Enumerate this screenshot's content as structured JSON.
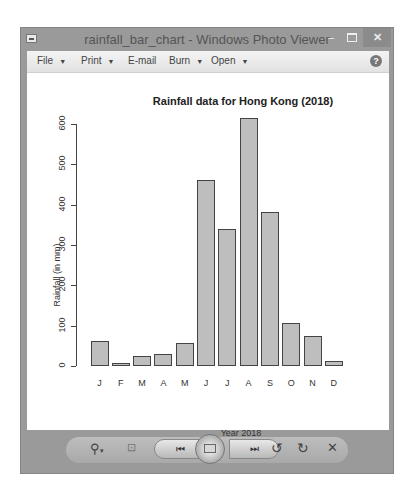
{
  "window": {
    "title": "rainfall_bar_chart - Windows Photo Viewer",
    "minimize": "–",
    "close": "✕"
  },
  "menu": {
    "file": "File",
    "print": "Print",
    "email": "E-mail",
    "burn": "Burn",
    "open": "Open",
    "help": "?"
  },
  "toolbar": {
    "zoom": "⚲",
    "zoom_caret": "▾",
    "actual_size": "⊡",
    "previous": "⏮",
    "next": "⏭",
    "rotate_ccw": "↺",
    "rotate_cw": "↻",
    "delete": "✕"
  },
  "chart_data": {
    "type": "bar",
    "title": "Rainfall data for Hong Kong (2018)",
    "xlabel": "Year 2018",
    "ylabel": "Rainfall (in mm)",
    "categories": [
      "J",
      "F",
      "M",
      "A",
      "M",
      "J",
      "J",
      "A",
      "S",
      "O",
      "N",
      "D"
    ],
    "values": [
      62,
      7,
      24,
      29,
      58,
      460,
      340,
      615,
      382,
      106,
      74,
      12
    ],
    "yticks": [
      "0",
      "100",
      "200",
      "300",
      "400",
      "500",
      "600"
    ],
    "ylim": [
      0,
      620
    ],
    "grid": false,
    "legend": null,
    "bar_color": "#bebebe",
    "bar_edge_color": "#444444"
  }
}
